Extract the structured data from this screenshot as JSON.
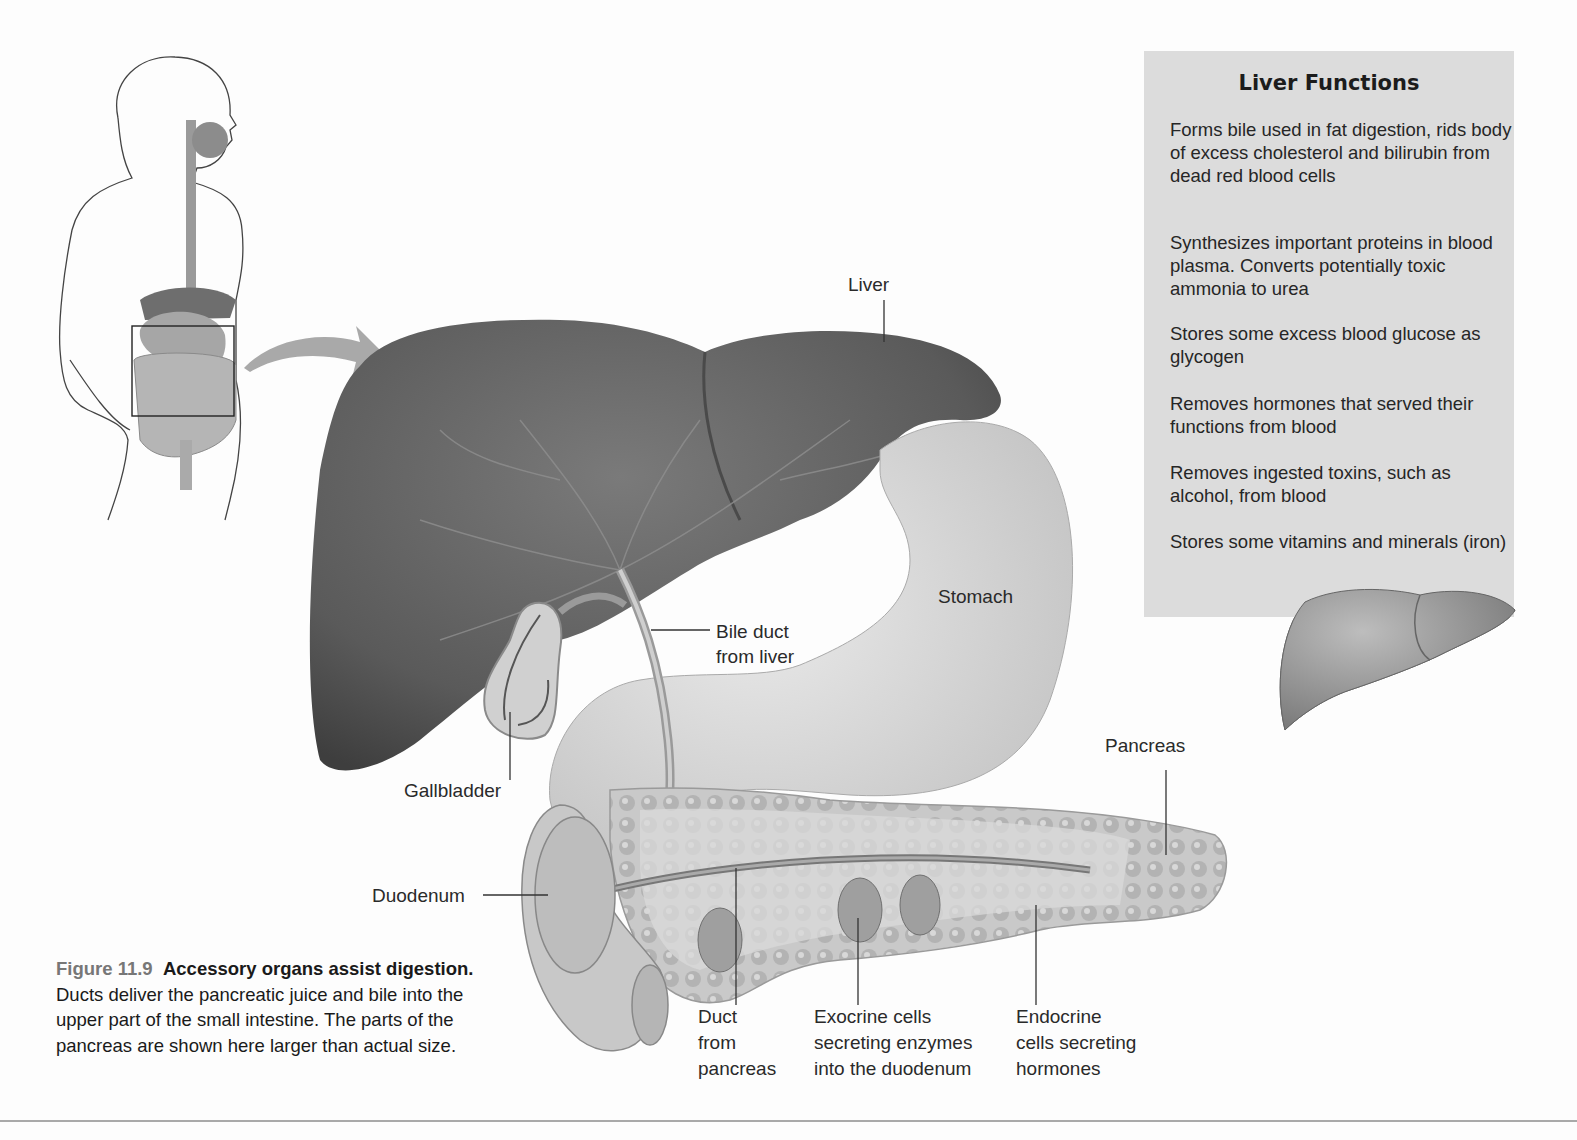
{
  "info_box": {
    "title": "Liver Functions",
    "items": [
      "Forms bile used in fat digestion, rids body of excess cholesterol and bilirubin from dead red blood cells",
      "Synthesizes important proteins in blood plasma. Converts potentially toxic ammonia to urea",
      "Stores some excess blood glucose as glycogen",
      "Removes hormones that served their functions from blood",
      "Removes ingested toxins, such as alcohol, from blood",
      "Stores some vitamins and minerals (iron)"
    ],
    "background": "#dcdcdc"
  },
  "labels": {
    "liver": "Liver",
    "stomach": "Stomach",
    "bile_duct_1": "Bile duct",
    "bile_duct_2": "from liver",
    "gallbladder": "Gallbladder",
    "duodenum": "Duodenum",
    "pancreas": "Pancreas",
    "duct_1": "Duct",
    "duct_2": "from",
    "duct_3": "pancreas",
    "exocrine_1": "Exocrine cells",
    "exocrine_2": "secreting enzymes",
    "exocrine_3": "into the duodenum",
    "endocrine_1": "Endocrine",
    "endocrine_2": "cells secreting",
    "endocrine_3": "hormones"
  },
  "caption": {
    "figure_number": "Figure 11.9",
    "title": "Accessory organs assist digestion.",
    "body": "Ducts deliver the pancreatic juice and bile into the upper part of the small intestine. The parts of the pancreas are shown here larger than actual size."
  }
}
